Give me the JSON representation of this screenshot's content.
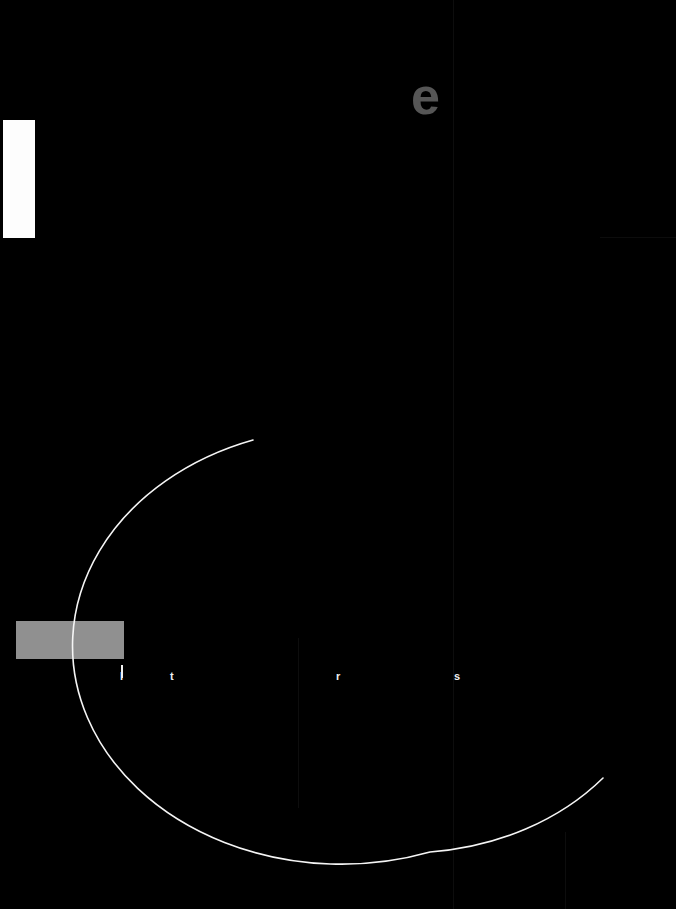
{
  "canvas": {
    "width": 676,
    "height": 909,
    "background_color": "#000000"
  },
  "shapes": {
    "white_block": {
      "name": "white-rectangle",
      "color": "#fdfdfd",
      "x": 3,
      "y": 120,
      "width": 32,
      "height": 118
    },
    "grey_block": {
      "name": "grey-rectangle",
      "color": "#909090",
      "x": 16,
      "y": 621,
      "width": 108,
      "height": 38
    },
    "tick_mark": {
      "name": "white-tick",
      "color": "#f2f2f2",
      "x": 121,
      "y": 665,
      "width": 2,
      "height": 13
    },
    "arc": {
      "name": "large-white-arc",
      "color": "#f5f5f5",
      "stroke_width": 1.6,
      "center_x": 430,
      "center_y": 646,
      "radius": 206,
      "path": "M 253 440 A 254 206 0 0 0 430 852 A 254 206 0 0 0 603 778"
    }
  },
  "glyphs": {
    "large_letter": {
      "text": "e",
      "color": "#565656",
      "x": 411,
      "y": 70,
      "size": 52
    },
    "mini_letters": [
      {
        "text": "l",
        "x": 120,
        "color": "#f0f0f0"
      },
      {
        "text": "t",
        "x": 170,
        "color": "#f0f0f0"
      },
      {
        "text": "r",
        "x": 336,
        "color": "#f0f0f0"
      },
      {
        "text": "s",
        "x": 454,
        "color": "#f0f0f0"
      }
    ]
  },
  "guides": {
    "vertical": [
      {
        "name": "guide-v-453",
        "x": 453,
        "y": 0,
        "height": 909,
        "color": "#0d0d0d"
      },
      {
        "name": "guide-v-298",
        "x": 298,
        "y": 638,
        "height": 170,
        "color": "#0d0d0d"
      },
      {
        "name": "guide-v-565",
        "x": 565,
        "y": 832,
        "height": 77,
        "color": "#0d0d0d"
      }
    ],
    "horizontal": [
      {
        "name": "guide-h-237",
        "x": 600,
        "y": 237,
        "width": 76,
        "color": "#0c0c0c"
      }
    ]
  }
}
